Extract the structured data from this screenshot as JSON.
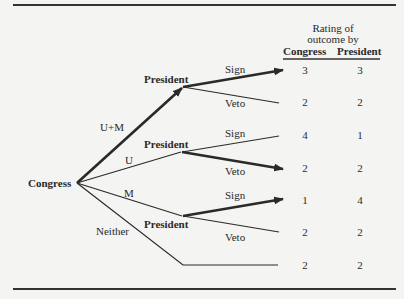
{
  "header": {
    "line1": "Rating of",
    "line2": "outcome by",
    "col_congress": "Congress",
    "col_president": "President"
  },
  "nodes": {
    "root": "Congress",
    "p1": "President",
    "p2": "President",
    "p3": "President"
  },
  "congress_moves": {
    "um": "U+M",
    "u": "U",
    "m": "M",
    "neither": "Neither"
  },
  "president_moves": {
    "p1_sign": "Sign",
    "p1_veto": "Veto",
    "p2_sign": "Sign",
    "p2_veto": "Veto",
    "p3_sign": "Sign",
    "p3_veto": "Veto"
  },
  "outcomes": [
    {
      "congress": "3",
      "president": "3"
    },
    {
      "congress": "2",
      "president": "2"
    },
    {
      "congress": "4",
      "president": "1"
    },
    {
      "congress": "2",
      "president": "2"
    },
    {
      "congress": "1",
      "president": "4"
    },
    {
      "congress": "2",
      "president": "2"
    },
    {
      "congress": "2",
      "president": "2"
    }
  ],
  "equilibrium_path_color": "#2a2a2a"
}
